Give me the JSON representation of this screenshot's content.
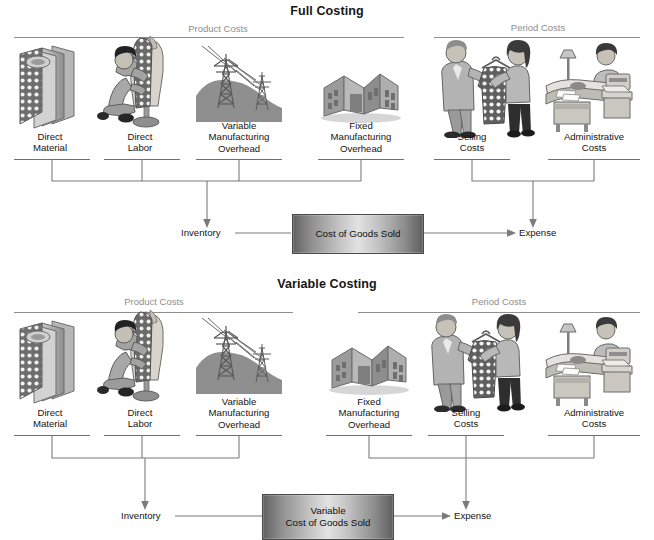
{
  "document": {
    "kind": "accounting-flow-diagram",
    "panels": [
      {
        "id": "full-costing",
        "title": "Full Costing",
        "groups": [
          {
            "id": "product-costs",
            "label": "Product Costs"
          },
          {
            "id": "period-costs",
            "label": "Period Costs"
          }
        ],
        "cost_items": [
          {
            "id": "direct-material",
            "label": "Direct\nMaterial",
            "group": "product-costs",
            "icon": "fabric-bolts-icon"
          },
          {
            "id": "direct-labor",
            "label": "Direct\nLabor",
            "group": "product-costs",
            "icon": "tailor-mannequin-icon"
          },
          {
            "id": "variable-moh",
            "label": "Variable\nManufacturing\nOverhead",
            "group": "product-costs",
            "icon": "power-lines-icon"
          },
          {
            "id": "fixed-moh",
            "label": "Fixed\nManufacturing\nOverhead",
            "group": "product-costs",
            "icon": "factory-icon"
          },
          {
            "id": "selling-costs",
            "label": "Selling\nCosts",
            "group": "period-costs",
            "icon": "salesperson-customer-icon"
          },
          {
            "id": "administrative-costs",
            "label": "Administrative\nCosts",
            "group": "period-costs",
            "icon": "office-desk-icon"
          }
        ],
        "destinations": {
          "inventory": "Inventory",
          "expense": "Expense"
        },
        "cogs_box": "Cost of Goods Sold"
      },
      {
        "id": "variable-costing",
        "title": "Variable Costing",
        "groups": [
          {
            "id": "product-costs",
            "label": "Product Costs"
          },
          {
            "id": "period-costs",
            "label": "Period Costs"
          }
        ],
        "cost_items": [
          {
            "id": "direct-material",
            "label": "Direct\nMaterial",
            "group": "product-costs",
            "icon": "fabric-bolts-icon"
          },
          {
            "id": "direct-labor",
            "label": "Direct\nLabor",
            "group": "product-costs",
            "icon": "tailor-mannequin-icon"
          },
          {
            "id": "variable-moh",
            "label": "Variable\nManufacturing\nOverhead",
            "group": "product-costs",
            "icon": "power-lines-icon"
          },
          {
            "id": "fixed-moh",
            "label": "Fixed\nManufacturing\nOverhead",
            "group": "period-costs",
            "icon": "factory-icon"
          },
          {
            "id": "selling-costs",
            "label": "Selling\nCosts",
            "group": "period-costs",
            "icon": "salesperson-customer-icon"
          },
          {
            "id": "administrative-costs",
            "label": "Administrative\nCosts",
            "group": "period-costs",
            "icon": "office-desk-icon"
          }
        ],
        "destinations": {
          "inventory": "Inventory",
          "expense": "Expense"
        },
        "cogs_box": "Variable\nCost of Goods Sold"
      }
    ],
    "colors": {
      "background": "#ffffff",
      "text": "#141414",
      "group_label": "#8d8d8d",
      "rule": "#7b7b7b",
      "box_border": "#4a4a4a"
    }
  }
}
